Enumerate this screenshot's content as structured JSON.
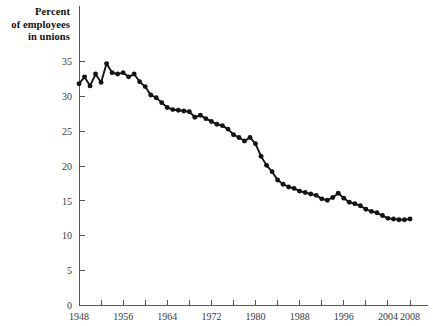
{
  "chart_data": {
    "type": "line",
    "title": "",
    "ylabel": "Percent\nof employees\nin unions",
    "xlabel": "",
    "xlim": [
      1948,
      2008
    ],
    "ylim": [
      0,
      36
    ],
    "grid": false,
    "legend": "none",
    "marker": "filled-circle",
    "line_color": "#141414",
    "y_ticks": [
      0,
      5,
      10,
      15,
      20,
      25,
      30,
      35
    ],
    "y_tick_labels": [
      "0",
      "5",
      "10",
      "15",
      "20",
      "25",
      "30",
      "35"
    ],
    "x_ticks": [
      1948,
      1952,
      1956,
      1960,
      1964,
      1968,
      1972,
      1976,
      1980,
      1984,
      1988,
      1992,
      1996,
      2000,
      2004,
      2008
    ],
    "x_tick_labels": [
      "1948",
      "",
      "1956",
      "",
      "1964",
      "",
      "1972",
      "",
      "1980",
      "",
      "1988",
      "",
      "1996",
      "",
      "2004",
      "2008"
    ],
    "x": [
      1948,
      1949,
      1950,
      1951,
      1952,
      1953,
      1954,
      1955,
      1956,
      1957,
      1958,
      1959,
      1960,
      1961,
      1962,
      1963,
      1964,
      1965,
      1966,
      1967,
      1968,
      1969,
      1970,
      1971,
      1972,
      1973,
      1974,
      1975,
      1976,
      1977,
      1978,
      1979,
      1980,
      1981,
      1982,
      1983,
      1984,
      1985,
      1986,
      1987,
      1988,
      1989,
      1990,
      1991,
      1992,
      1993,
      1994,
      1995,
      1996,
      1997,
      1998,
      1999,
      2000,
      2001,
      2002,
      2003,
      2004,
      2005,
      2006,
      2007,
      2008
    ],
    "y": [
      31.8,
      32.8,
      31.5,
      33.2,
      32.0,
      34.7,
      33.4,
      33.2,
      33.4,
      32.8,
      33.2,
      32.1,
      31.4,
      30.2,
      29.8,
      29.1,
      28.4,
      28.1,
      28.0,
      27.9,
      27.8,
      27.0,
      27.3,
      26.8,
      26.4,
      26.0,
      25.8,
      25.3,
      24.5,
      24.1,
      23.6,
      24.1,
      23.2,
      21.4,
      20.1,
      19.2,
      18.0,
      17.4,
      17.0,
      16.8,
      16.4,
      16.2,
      16.0,
      15.8,
      15.3,
      15.1,
      15.5,
      16.1,
      15.4,
      14.8,
      14.6,
      14.3,
      13.8,
      13.5,
      13.3,
      12.9,
      12.5,
      12.4,
      12.3,
      12.3,
      12.4
    ]
  },
  "labels": {
    "axis_title_line1": "Percent",
    "axis_title_line2": "of employees",
    "axis_title_line3": "in unions"
  }
}
